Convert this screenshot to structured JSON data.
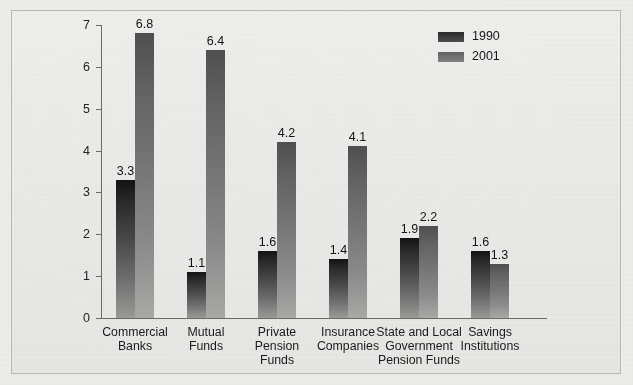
{
  "chart_data": {
    "type": "bar",
    "title": "",
    "subtitle": "",
    "xlabel": "",
    "ylabel": "",
    "ylim": [
      0,
      7
    ],
    "yticks": [
      0,
      1,
      2,
      3,
      4,
      5,
      6,
      7
    ],
    "ytick_labels": [
      "0",
      "1",
      "2",
      "3",
      "4",
      "5",
      "6",
      "7"
    ],
    "grid": false,
    "legend_position": "top-right",
    "categories": [
      "Commercial\nBanks",
      "Mutual\nFunds",
      "Private\nPension\nFunds",
      "Insurance\nCompanies",
      "State and Local\nGovernment\nPension Funds",
      "Savings\nInstitutions"
    ],
    "series": [
      {
        "name": "1990",
        "color": "#2b2b2b",
        "values": [
          3.3,
          1.1,
          1.6,
          1.4,
          1.9,
          1.6
        ],
        "labels": [
          "3.3",
          "1.1",
          "1.6",
          "1.4",
          "1.9",
          "1.6"
        ]
      },
      {
        "name": "2001",
        "color": "#6e6e6e",
        "values": [
          6.8,
          6.4,
          4.2,
          4.1,
          2.2,
          1.3
        ],
        "labels": [
          "6.8",
          "6.4",
          "4.2",
          "4.1",
          "2.2",
          "1.3"
        ]
      }
    ]
  },
  "legend": {
    "entries": [
      {
        "label": "1990"
      },
      {
        "label": "2001"
      }
    ]
  },
  "colors": {
    "background": "#ececeb",
    "panel": "#e9e9e7",
    "axis": "#6b6b69",
    "series_1990": "#2b2b2b",
    "series_2001": "#6e6e6e",
    "text": "#1b1b1b"
  }
}
